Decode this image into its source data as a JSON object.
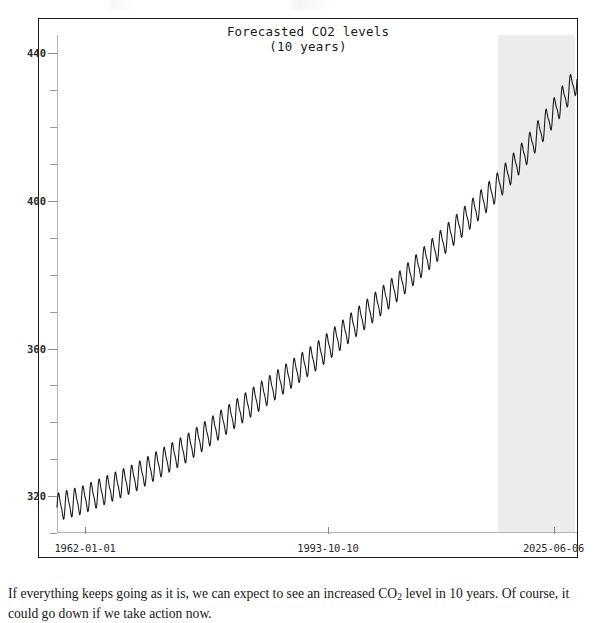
{
  "page": {
    "caption_text_before_sub": "If everything keeps going as it is, we can expect to see an increased CO",
    "caption_sub": "2",
    "caption_text_after_sub": " level in 10 years. Of course, it could go down if we take action now."
  },
  "chart_data": {
    "type": "line",
    "title": "Forecasted CO2 levels",
    "subtitle": "(10 years)",
    "xlabel": "",
    "ylabel": "",
    "grid": false,
    "legend": "none",
    "ylim": [
      310,
      445
    ],
    "y_major_ticks": [
      320,
      360,
      400,
      440
    ],
    "y_major_tick_labels": [
      "320",
      "360",
      "400",
      "440"
    ],
    "y_minor_tick_count_between": 3,
    "x_tick_labels": [
      "1962-01-01",
      "1993-10-10",
      "2025-06-06"
    ],
    "x_tick_fractions": [
      0.054,
      0.521,
      0.955
    ],
    "xlim_labels": [
      "1962-01-01",
      "2025-06-06"
    ],
    "annotations": [
      {
        "name": "forecast-band",
        "kind": "shaded-region",
        "label": "forecast 10 years",
        "color": "#ececec",
        "x_start_fraction": 0.848,
        "x_end_fraction": 0.996
      }
    ],
    "series": [
      {
        "name": "CO2 concentration (ppm)",
        "color": "#1c1c1c",
        "description": "Monthly atmospheric CO2 with strong seasonal sawtooth oscillation superimposed on a rising trend",
        "trend_start_ppm": 317,
        "trend_end_ppm": 433,
        "seasonal_amplitude_ppm": 3.4,
        "seasonal_period_years": 1,
        "cycles_drawn": 64,
        "trend_points": [
          {
            "x_fraction": 0.0,
            "ppm": 317
          },
          {
            "x_fraction": 0.05,
            "ppm": 319
          },
          {
            "x_fraction": 0.1,
            "ppm": 322
          },
          {
            "x_fraction": 0.15,
            "ppm": 325
          },
          {
            "x_fraction": 0.2,
            "ppm": 329
          },
          {
            "x_fraction": 0.25,
            "ppm": 333
          },
          {
            "x_fraction": 0.3,
            "ppm": 338
          },
          {
            "x_fraction": 0.35,
            "ppm": 343
          },
          {
            "x_fraction": 0.4,
            "ppm": 348
          },
          {
            "x_fraction": 0.45,
            "ppm": 353
          },
          {
            "x_fraction": 0.5,
            "ppm": 358
          },
          {
            "x_fraction": 0.55,
            "ppm": 364
          },
          {
            "x_fraction": 0.6,
            "ppm": 370
          },
          {
            "x_fraction": 0.65,
            "ppm": 376
          },
          {
            "x_fraction": 0.7,
            "ppm": 383
          },
          {
            "x_fraction": 0.75,
            "ppm": 390
          },
          {
            "x_fraction": 0.8,
            "ppm": 397
          },
          {
            "x_fraction": 0.848,
            "ppm": 404
          },
          {
            "x_fraction": 0.9,
            "ppm": 413
          },
          {
            "x_fraction": 0.95,
            "ppm": 423
          },
          {
            "x_fraction": 1.0,
            "ppm": 433
          }
        ]
      }
    ]
  }
}
